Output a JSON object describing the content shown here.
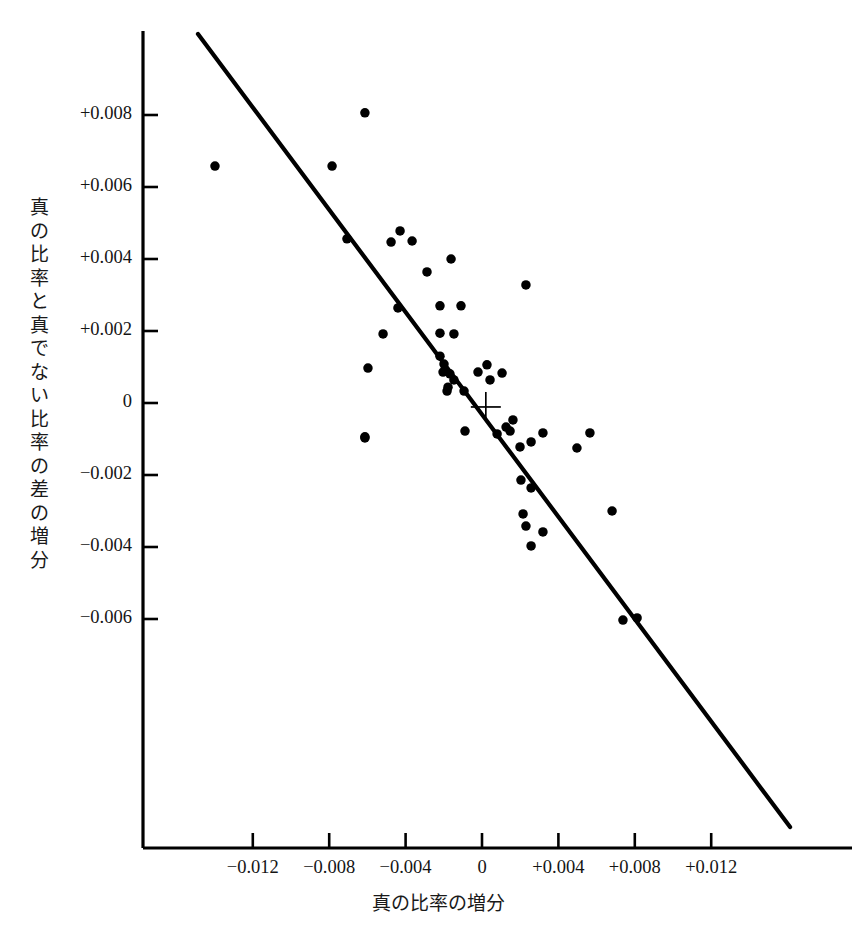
{
  "figure": {
    "background": "#ffffff",
    "ink_color": "#000000",
    "axis_color": "#000000"
  },
  "chart_data": {
    "type": "scatter",
    "title": "",
    "xlabel": "真の比率の増分",
    "ylabel": "真の比率と真でない比率の差の増分",
    "ylabel_chars": [
      "真",
      "の",
      "比",
      "率",
      "と",
      "真",
      "で",
      "な",
      "い",
      "比",
      "率",
      "の",
      "差",
      "の",
      "増",
      "分"
    ],
    "xlim": [
      -0.0177,
      0.0196
    ],
    "ylim": [
      -0.0114,
      0.0103
    ],
    "xticks": [
      -0.012,
      -0.008,
      -0.004,
      0,
      0.004,
      0.008,
      0.012
    ],
    "xtick_labels": [
      "−0.012",
      "−0.008",
      "−0.004",
      "0",
      "+0.004",
      "+0.008",
      "+0.012"
    ],
    "yticks": [
      -0.006,
      -0.004,
      -0.002,
      0,
      0.002,
      0.004,
      0.006,
      0.008
    ],
    "ytick_labels": [
      "−0.006",
      "−0.004",
      "−0.002",
      "0",
      "+0.002",
      "+0.004",
      "+0.006",
      "+0.008"
    ],
    "grid": false,
    "legend": null,
    "marker": {
      "shape": "circle",
      "size_px": 9.5,
      "color": "#000000"
    },
    "points": [
      [
        -0.01398,
        0.00658
      ],
      [
        -0.00613,
        0.00806
      ],
      [
        -0.00785,
        0.00658
      ],
      [
        -0.00707,
        0.00456
      ],
      [
        -0.00429,
        0.00478
      ],
      [
        -0.00476,
        0.00447
      ],
      [
        -0.00366,
        0.0045
      ],
      [
        -0.00288,
        0.00364
      ],
      [
        -0.0044,
        0.00264
      ],
      [
        -0.00518,
        0.00192
      ],
      [
        -0.0022,
        0.0027
      ],
      [
        -0.00162,
        0.004
      ],
      [
        -0.0011,
        0.0027
      ],
      [
        0.0023,
        0.00328
      ],
      [
        -0.00597,
        0.00097
      ],
      [
        -0.0022,
        0.00194
      ],
      [
        -0.00147,
        0.00192
      ],
      [
        -0.0022,
        0.0013
      ],
      [
        -0.00199,
        0.00108
      ],
      [
        -0.00204,
        0.00086
      ],
      [
        -0.00168,
        0.00081
      ],
      [
        -0.00147,
        0.00064
      ],
      [
        -0.00178,
        0.00044
      ],
      [
        -0.00183,
        0.00033
      ],
      [
        -0.00094,
        0.00033
      ],
      [
        -0.00021,
        0.00086
      ],
      [
        0.00026,
        0.00106
      ],
      [
        0.00042,
        0.00064
      ],
      [
        0.00105,
        0.00083
      ],
      [
        -0.00613,
        -0.00097
      ],
      [
        -0.00613,
        -0.00094
      ],
      [
        -0.00089,
        -0.00078
      ],
      [
        0.00162,
        -0.00047
      ],
      [
        0.00126,
        -0.00067
      ],
      [
        0.00079,
        -0.00086
      ],
      [
        0.00147,
        -0.00078
      ],
      [
        0.00199,
        -0.00122
      ],
      [
        0.00257,
        -0.00108
      ],
      [
        0.00319,
        -0.00083
      ],
      [
        0.00497,
        -0.00125
      ],
      [
        0.00565,
        -0.00083
      ],
      [
        0.00204,
        -0.00214
      ],
      [
        0.00257,
        -0.00236
      ],
      [
        0.00215,
        -0.00308
      ],
      [
        0.0023,
        -0.00342
      ],
      [
        0.00319,
        -0.00358
      ],
      [
        0.00257,
        -0.00397
      ],
      [
        0.00681,
        -0.003
      ],
      [
        0.00738,
        -0.00603
      ],
      [
        0.00812,
        -0.00597
      ]
    ],
    "fit_line": {
      "x_start": -0.01487,
      "y_start": 0.01025,
      "x_end": 0.01613,
      "y_end": -0.01178,
      "width_px": 4.2
    },
    "center_marker": {
      "shape": "plus",
      "x": 0.0002,
      "y": -0.00011,
      "size_px": 30
    }
  }
}
